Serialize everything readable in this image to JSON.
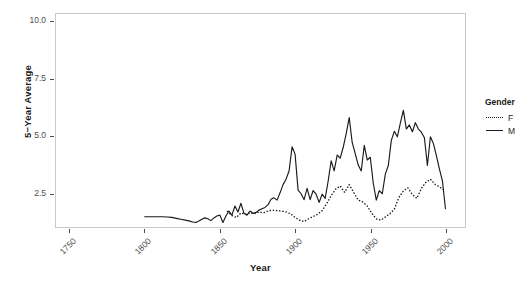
{
  "chart_data": {
    "type": "line",
    "title": "",
    "xlabel": "Year",
    "ylabel": "5−Year Average",
    "xlim": [
      1741,
      2013
    ],
    "ylim": [
      1.0,
      10.35
    ],
    "xticks": [
      1750,
      1800,
      1850,
      1900,
      1950,
      2000
    ],
    "yticks": [
      2.5,
      5.0,
      7.5,
      10.0
    ],
    "xtick_labels": [
      "1750",
      "1800",
      "1850",
      "1900",
      "1950",
      "2000"
    ],
    "ytick_labels": [
      "2.5",
      "5.0",
      "7.5",
      "10.0"
    ],
    "grid": false,
    "legend_position": "right",
    "legend_title": "Gender",
    "series": [
      {
        "name": "M",
        "label": "M",
        "linestyle": "solid",
        "color": "#1a1a1a",
        "x": [
          1800,
          1803,
          1806,
          1809,
          1812,
          1815,
          1818,
          1821,
          1824,
          1827,
          1830,
          1832,
          1834,
          1836,
          1838,
          1840,
          1842,
          1844,
          1846,
          1848,
          1850,
          1852,
          1854,
          1856,
          1858,
          1860,
          1862,
          1864,
          1866,
          1868,
          1870,
          1872,
          1874,
          1876,
          1878,
          1880,
          1882,
          1884,
          1886,
          1888,
          1890,
          1892,
          1894,
          1896,
          1898,
          1900,
          1902,
          1904,
          1906,
          1908,
          1910,
          1912,
          1914,
          1916,
          1918,
          1920,
          1922,
          1924,
          1926,
          1928,
          1930,
          1932,
          1934,
          1936,
          1938,
          1940,
          1942,
          1944,
          1946,
          1948,
          1950,
          1952,
          1954,
          1956,
          1958,
          1960,
          1962,
          1964,
          1966,
          1968,
          1970,
          1972,
          1974,
          1976,
          1978,
          1980,
          1982,
          1984,
          1986,
          1988,
          1990,
          1992,
          1994,
          1996,
          1998,
          2000
        ],
        "y": [
          1.45,
          1.45,
          1.45,
          1.45,
          1.45,
          1.44,
          1.42,
          1.38,
          1.34,
          1.3,
          1.26,
          1.22,
          1.2,
          1.26,
          1.34,
          1.4,
          1.36,
          1.28,
          1.4,
          1.48,
          1.52,
          1.2,
          1.48,
          1.7,
          1.52,
          1.92,
          1.66,
          2.04,
          1.6,
          1.52,
          1.7,
          1.6,
          1.64,
          1.74,
          1.8,
          1.86,
          1.98,
          2.22,
          2.28,
          2.18,
          2.5,
          2.86,
          3.1,
          3.46,
          4.52,
          4.2,
          2.62,
          2.46,
          2.2,
          2.7,
          2.2,
          2.6,
          2.44,
          2.08,
          2.44,
          2.26,
          3.02,
          3.9,
          3.46,
          4.16,
          4.02,
          4.5,
          5.1,
          5.8,
          4.7,
          4.22,
          3.72,
          3.46,
          4.58,
          3.94,
          4.06,
          2.92,
          2.18,
          2.6,
          2.46,
          3.32,
          3.7,
          4.8,
          5.2,
          4.96,
          5.56,
          6.12,
          5.3,
          5.48,
          5.18,
          5.58,
          5.3,
          5.16,
          4.92,
          3.7,
          4.96,
          4.66,
          4.12,
          3.54,
          3.02,
          1.8
        ]
      },
      {
        "name": "F",
        "label": "F",
        "linestyle": "dotted",
        "color": "#1a1a1a",
        "x": [
          1855,
          1858,
          1861,
          1864,
          1867,
          1870,
          1873,
          1876,
          1879,
          1882,
          1885,
          1888,
          1891,
          1894,
          1897,
          1900,
          1903,
          1906,
          1909,
          1912,
          1915,
          1918,
          1921,
          1924,
          1927,
          1930,
          1933,
          1936,
          1939,
          1942,
          1945,
          1948,
          1951,
          1954,
          1957,
          1960,
          1963,
          1966,
          1969,
          1972,
          1975,
          1978,
          1981,
          1984,
          1987,
          1990,
          1993,
          1996,
          2000
        ],
        "y": [
          1.68,
          1.5,
          1.42,
          1.62,
          1.56,
          1.62,
          1.58,
          1.66,
          1.62,
          1.7,
          1.74,
          1.72,
          1.7,
          1.66,
          1.58,
          1.42,
          1.3,
          1.24,
          1.36,
          1.46,
          1.56,
          1.72,
          2.02,
          2.38,
          2.66,
          2.8,
          2.52,
          2.86,
          2.52,
          2.18,
          2.1,
          1.92,
          1.6,
          1.36,
          1.3,
          1.44,
          1.58,
          1.78,
          2.3,
          2.58,
          2.72,
          2.42,
          2.26,
          2.7,
          2.96,
          3.1,
          2.88,
          2.76,
          2.58
        ]
      }
    ]
  },
  "axes": {
    "y_title": "5−Year Average",
    "x_title": "Year"
  },
  "legend": {
    "title": "Gender",
    "items": [
      {
        "label": "F",
        "style": "dotted"
      },
      {
        "label": "M",
        "style": "solid"
      }
    ]
  },
  "colors": {
    "line": "#1a1a1a",
    "panel_border": "#c9c9c9",
    "panel_background": "#ffffff",
    "axis_text": "#4d4d4d",
    "title_text": "#1a1a1a"
  }
}
